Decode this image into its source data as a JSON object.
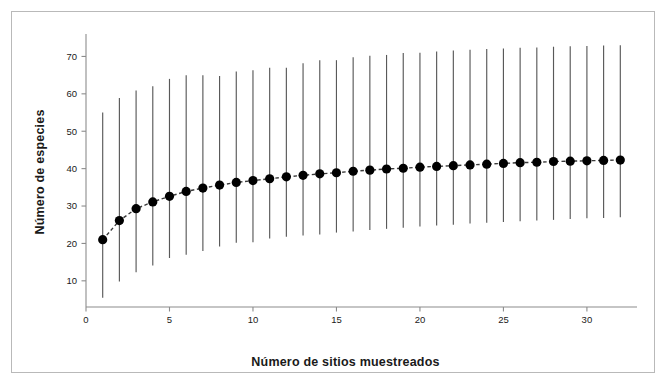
{
  "chart_data": {
    "type": "line",
    "title": "",
    "subtitle": "",
    "xlabel": "Número de sitios muestreados",
    "ylabel": "Número de especies",
    "xlim": [
      0,
      33
    ],
    "ylim": [
      3,
      76
    ],
    "xticks": [
      0,
      5,
      10,
      15,
      20,
      25,
      30
    ],
    "yticks": [
      10,
      20,
      30,
      40,
      50,
      60,
      70
    ],
    "xtick_labels": [
      "0",
      "5",
      "10",
      "15",
      "20",
      "25",
      "30"
    ],
    "ytick_labels": [
      "10",
      "20",
      "30",
      "40",
      "50",
      "60",
      "70"
    ],
    "grid": false,
    "legend": null,
    "marker": "filled-circle",
    "line_style": "dashed",
    "errorbar_style": "vertical-line",
    "series": [
      {
        "name": "Riqueza acumulada de especies",
        "x": [
          1,
          2,
          3,
          4,
          5,
          6,
          7,
          8,
          9,
          10,
          11,
          12,
          13,
          14,
          15,
          16,
          17,
          18,
          19,
          20,
          21,
          22,
          23,
          24,
          25,
          26,
          27,
          28,
          29,
          30,
          31,
          32
        ],
        "values": [
          21.0,
          26.1,
          29.3,
          31.1,
          32.6,
          33.9,
          34.8,
          35.6,
          36.3,
          36.8,
          37.3,
          37.8,
          38.2,
          38.6,
          38.9,
          39.3,
          39.6,
          39.9,
          40.1,
          40.4,
          40.6,
          40.8,
          41.0,
          41.2,
          41.4,
          41.6,
          41.7,
          41.9,
          42.0,
          42.1,
          42.2,
          42.3
        ],
        "ci_lower": [
          5.5,
          9.8,
          12.3,
          14.1,
          16.1,
          17.0,
          18.0,
          19.2,
          20.2,
          20.3,
          21.3,
          21.8,
          22.1,
          22.4,
          22.9,
          23.2,
          23.6,
          23.9,
          24.2,
          24.5,
          24.8,
          25.0,
          25.3,
          25.5,
          25.7,
          25.9,
          26.1,
          26.3,
          26.5,
          26.7,
          26.8,
          27.0
        ],
        "ci_upper": [
          55.0,
          58.9,
          60.9,
          62.0,
          64.0,
          65.0,
          65.0,
          64.8,
          66.0,
          66.3,
          67.0,
          67.0,
          68.2,
          69.0,
          69.0,
          69.8,
          70.2,
          70.4,
          70.9,
          71.0,
          71.3,
          71.6,
          71.8,
          72.0,
          72.1,
          72.3,
          72.4,
          72.6,
          72.7,
          72.8,
          72.9,
          73.0
        ]
      }
    ],
    "colors": {
      "marker": "#000000",
      "line": "#3a3a3a",
      "errorbar": "#595959",
      "axis": "#8c8c8c",
      "text": "#1a1a1a",
      "frame": "#b9b9b9",
      "background": "#ffffff"
    }
  }
}
